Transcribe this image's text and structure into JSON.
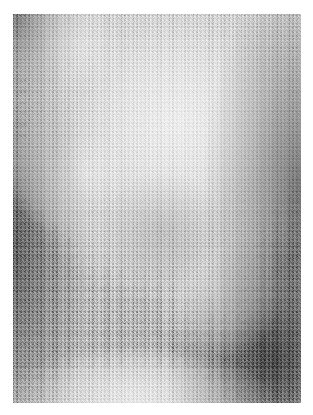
{
  "figure": {
    "kind": "grayscale-texture-micrograph",
    "caption": "",
    "canvas": {
      "width": 313,
      "height": 415,
      "background": "#ffffff"
    },
    "image_area": {
      "x": 13,
      "y": 14,
      "width": 288,
      "height": 389
    },
    "palette": {
      "background": "#ffffff",
      "base_mid_gray": "#7a7a7a",
      "darkest": "#3f3f3f",
      "dark": "#4e4e4e",
      "mid": "#6e6e6e",
      "light": "#a8a8a8",
      "brightest": "#c6c6c6"
    },
    "texture": {
      "description": "dense fine-grain speckle noise over smooth low-frequency luminance field",
      "grain_scale_px": 2,
      "contrast": "high"
    },
    "luminance_features": [
      {
        "name": "central-bright-lobe",
        "cx_pct": 56,
        "cy_pct": 28,
        "rx_pct": 40,
        "ry_pct": 34,
        "level": "#c6c6c6"
      },
      {
        "name": "upper-left-speckle-patch",
        "cx_pct": 22,
        "cy_pct": 8,
        "rx_pct": 16,
        "ry_pct": 10,
        "level": "#b4b4b4"
      },
      {
        "name": "left-mid-bright-spot",
        "cx_pct": 25,
        "cy_pct": 40,
        "rx_pct": 14,
        "ry_pct": 10,
        "level": "#bcbcbc"
      },
      {
        "name": "lower-right-faint-blob",
        "cx_pct": 70,
        "cy_pct": 70,
        "rx_pct": 14,
        "ry_pct": 11,
        "level": "#8e8e8e"
      },
      {
        "name": "bottom-bright-band",
        "cx_pct": 42,
        "cy_pct": 99,
        "rx_pct": 30,
        "ry_pct": 9,
        "level": "#b2b2b2"
      },
      {
        "name": "left-edge-shadow",
        "cx_pct": 0,
        "cy_pct": 55,
        "rx_pct": 16,
        "ry_pct": 55,
        "level": "#4e4e4e"
      },
      {
        "name": "right-edge-shadow",
        "cx_pct": 100,
        "cy_pct": 45,
        "rx_pct": 16,
        "ry_pct": 60,
        "level": "#4a4a4a"
      },
      {
        "name": "bottom-right-shadow",
        "cx_pct": 88,
        "cy_pct": 86,
        "rx_pct": 26,
        "ry_pct": 26,
        "level": "#464646"
      },
      {
        "name": "upper-left-corner-shadow",
        "cx_pct": 3,
        "cy_pct": 5,
        "rx_pct": 14,
        "ry_pct": 12,
        "level": "#565656"
      }
    ]
  }
}
